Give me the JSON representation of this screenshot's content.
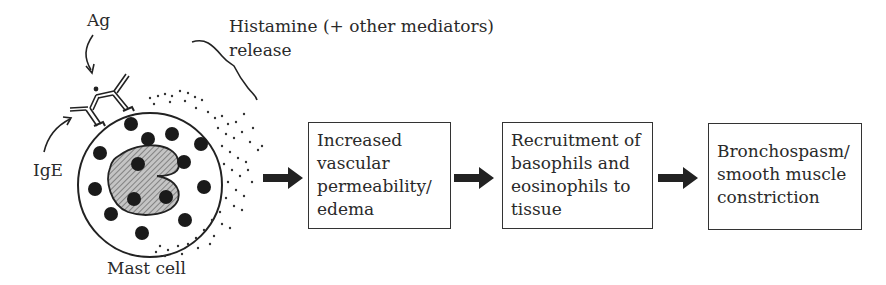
{
  "figure": {
    "cell": {
      "label": "Mast cell",
      "antigen_label": "Ag",
      "antibody_label": "IgE",
      "release_label_line1": "Histamine (+ other mediators)",
      "release_label_line2": "release"
    },
    "steps": [
      {
        "lines": [
          "Increased",
          "vascular",
          "permeability/",
          "edema"
        ]
      },
      {
        "lines": [
          "Recruitment of",
          "basophils and",
          "eosinophils to",
          "tissue"
        ]
      },
      {
        "lines": [
          "Bronchospasm/",
          "smooth muscle",
          "constriction"
        ]
      }
    ],
    "colors": {
      "ink": "#2a2a2a",
      "nucleus_fill": "#9a9a9a",
      "granule": "#1a1a1a"
    }
  }
}
